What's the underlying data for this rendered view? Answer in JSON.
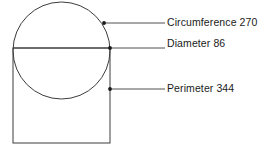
{
  "figure": {
    "stroke_color": "#3c3c3c",
    "text_color": "#1a1a1a",
    "background_color": "#ffffff",
    "shapes": {
      "circle": {
        "name": "circle",
        "cx": 61.5,
        "cy": 50.5,
        "r": 48.5
      },
      "rectangle": {
        "name": "rectangle",
        "x": 13,
        "y": 48,
        "width": 97,
        "height": 95
      },
      "diameter_line": {
        "name": "diameter-line",
        "x1": 13,
        "y1": 48,
        "x2": 110,
        "y2": 48
      }
    },
    "leaders": [
      {
        "id": "circumference",
        "dot_x": 104,
        "dot_y": 23,
        "line_x2": 165,
        "line_y": 23
      },
      {
        "id": "diameter",
        "dot_x": 110,
        "dot_y": 48,
        "line_x2": 165,
        "line_y": 48
      },
      {
        "id": "perimeter",
        "dot_x": 110,
        "dot_y": 89,
        "line_x2": 165,
        "line_y": 89
      }
    ]
  },
  "labels": {
    "circumference": "Circumference 270",
    "diameter": "Diameter 86",
    "perimeter": "Perimeter 344"
  },
  "measurements": {
    "circumference_value": 270,
    "diameter_value": 86,
    "perimeter_value": 344
  }
}
